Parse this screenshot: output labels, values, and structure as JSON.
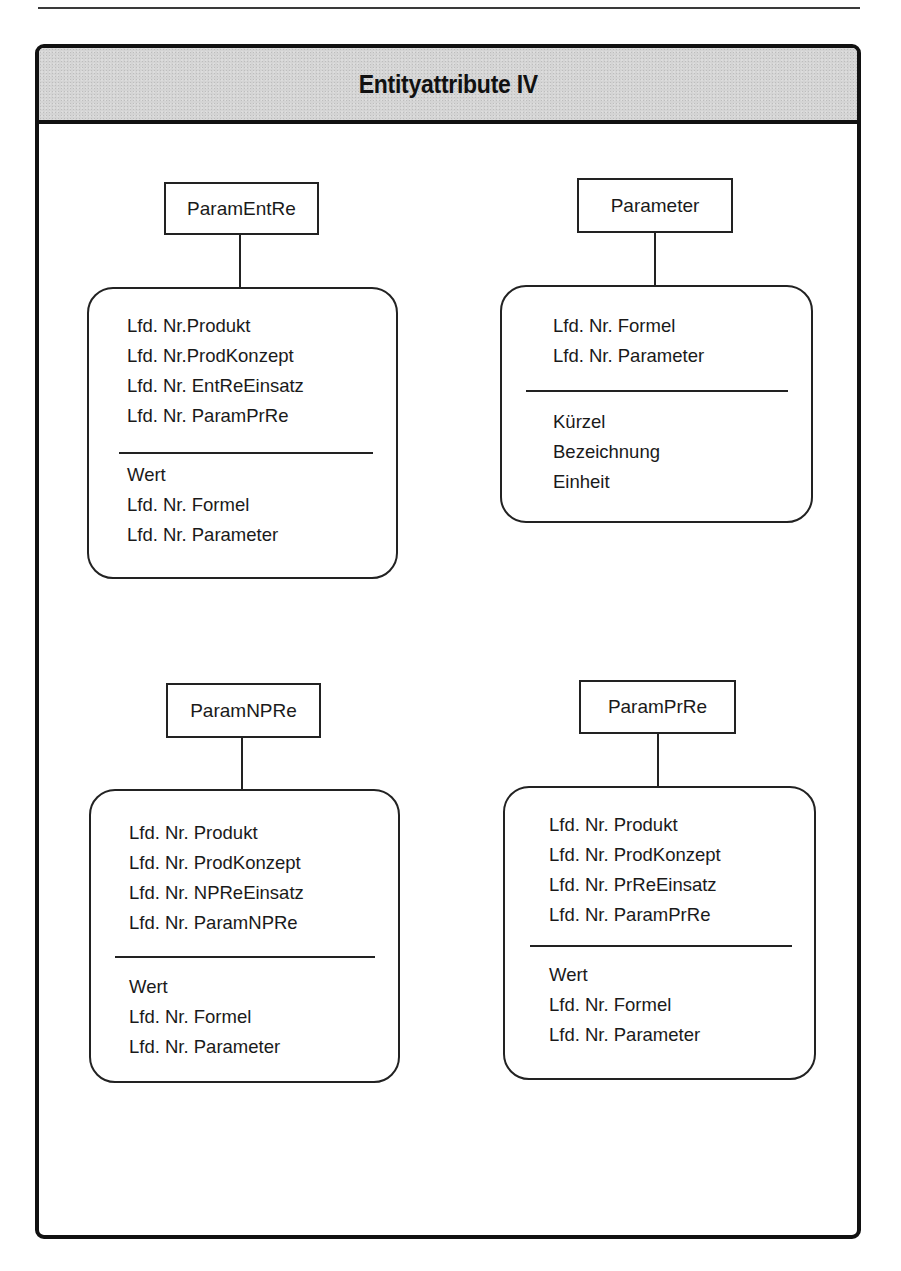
{
  "diagram": {
    "title": "Entityattribute IV",
    "entities": [
      {
        "id": "ParamEntRe",
        "name": "ParamEntRe",
        "key_attributes": [
          "Lfd. Nr.Produkt",
          "Lfd. Nr.ProdKonzept",
          "Lfd. Nr. EntReEinsatz",
          "Lfd. Nr. ParamPrRe"
        ],
        "attributes": [
          "Wert",
          "Lfd. Nr. Formel",
          "Lfd. Nr. Parameter"
        ]
      },
      {
        "id": "Parameter",
        "name": "Parameter",
        "key_attributes": [
          "Lfd. Nr. Formel",
          "Lfd. Nr. Parameter"
        ],
        "attributes": [
          "Kürzel",
          "Bezeichnung",
          "Einheit"
        ]
      },
      {
        "id": "ParamNPRe",
        "name": "ParamNPRe",
        "key_attributes": [
          "Lfd. Nr. Produkt",
          "Lfd. Nr. ProdKonzept",
          "Lfd. Nr. NPReEinsatz",
          "Lfd. Nr. ParamNPRe"
        ],
        "attributes": [
          "Wert",
          "Lfd. Nr. Formel",
          "Lfd. Nr. Parameter"
        ]
      },
      {
        "id": "ParamPrRe",
        "name": "ParamPrRe",
        "key_attributes": [
          "Lfd. Nr. Produkt",
          "Lfd. Nr. ProdKonzept",
          "Lfd. Nr. PrReEinsatz",
          "Lfd. Nr. ParamPrRe"
        ],
        "attributes": [
          "Wert",
          "Lfd. Nr. Formel",
          "Lfd. Nr. Parameter"
        ]
      }
    ]
  },
  "colors": {
    "header_fill": "#d4d4d4",
    "line": "#222222",
    "frame_border": "#111111",
    "background": "#ffffff"
  }
}
